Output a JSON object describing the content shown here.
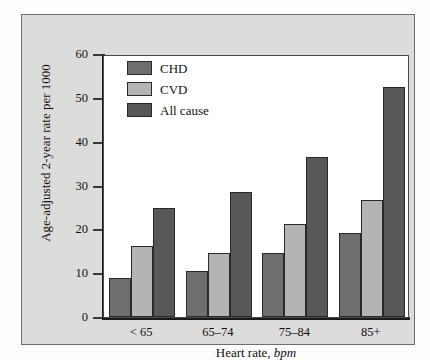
{
  "chart_data": {
    "type": "bar",
    "title": "",
    "subtitle": "",
    "xlabel_main": "Heart rate,",
    "xlabel_italic": "bpm",
    "ylabel": "Age-adjusted 2-year rate per 1000",
    "categories": [
      "< 65",
      "65–74",
      "75–84",
      "85+"
    ],
    "series": [
      {
        "name": "CHD",
        "color": "#6e6e6e",
        "values": [
          9.0,
          10.6,
          14.7,
          19.1
        ]
      },
      {
        "name": "CVD",
        "color": "#b4b4b4",
        "values": [
          16.2,
          14.7,
          21.3,
          26.7
        ]
      },
      {
        "name": "All cause",
        "color": "#585858",
        "values": [
          24.8,
          28.5,
          36.5,
          52.4
        ]
      }
    ],
    "ylim": [
      0,
      60
    ],
    "yticks": [
      0,
      10,
      20,
      30,
      40,
      50,
      60
    ],
    "ytick_labels": [
      "0",
      "10",
      "20",
      "30",
      "40",
      "50",
      "60"
    ],
    "grid": false,
    "legend_position": "upper-left-inside"
  },
  "legend": {
    "items": [
      {
        "label": "CHD",
        "color": "#6e6e6e"
      },
      {
        "label": "CVD",
        "color": "#b4b4b4"
      },
      {
        "label": "All cause",
        "color": "#585858"
      }
    ]
  },
  "colors": {
    "panel_background": "#dcdcda",
    "plot_background": "#ffffff",
    "axis": "#1a1a1a",
    "text": "#111111"
  }
}
